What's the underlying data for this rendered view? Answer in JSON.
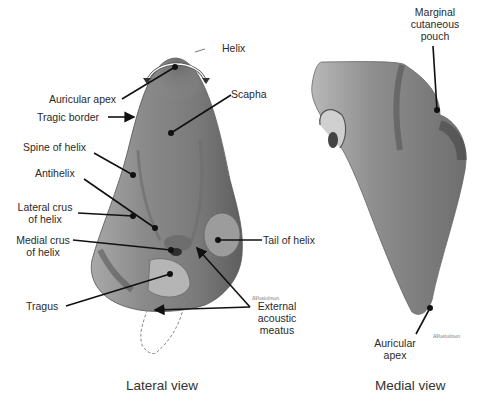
{
  "figure": {
    "lateral": {
      "caption": "Lateral view",
      "labels": {
        "helix": "Helix",
        "auricular_apex": "Auricular apex",
        "scapha": "Scapha",
        "tragic_border": "Tragic border",
        "spine_of_helix": "Spine of helix",
        "antihelix": "Antihelix",
        "lateral_crus_1": "Lateral crus",
        "lateral_crus_2": "of helix",
        "medial_crus_1": "Medial crus",
        "medial_crus_2": "of helix",
        "tail_of_helix": "Tail of helix",
        "tragus": "Tragus",
        "ext_acoustic_1": "External",
        "ext_acoustic_2": "acoustic",
        "ext_acoustic_3": "meatus"
      },
      "signature": "RPostalman"
    },
    "medial": {
      "caption": "Medial view",
      "labels": {
        "marginal_1": "Marginal",
        "marginal_2": "cutaneous",
        "marginal_3": "pouch",
        "apex_1": "Auricular",
        "apex_2": "apex"
      },
      "signature": "RPostalman"
    },
    "colors": {
      "ink": "#111111",
      "ear_dark": "#5a5a5a",
      "ear_mid": "#8c8c8c",
      "ear_light": "#c8c8c8",
      "background": "#ffffff"
    }
  }
}
